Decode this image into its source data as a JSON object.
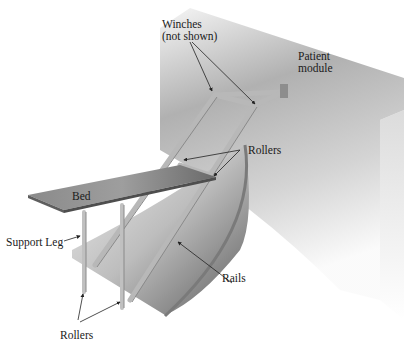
{
  "diagram": {
    "type": "technical-illustration",
    "labels": {
      "winches_line1": "Winches",
      "winches_line2": "(not shown)",
      "patient_module_line1": "Patient",
      "patient_module_line2": "module",
      "rollers_upper": "Rollers",
      "bed": "Bed",
      "support_leg": "Support Leg",
      "rails": "Rails",
      "rollers_lower": "Rollers"
    },
    "colors": {
      "background": "#ffffff",
      "text": "#1a1a1a",
      "module_dark": "#9a9a9a",
      "module_light": "#f2f2f2",
      "rail_surface_dark": "#6f6f6f",
      "rail_surface_light": "#e6e6e6",
      "frame": "#b5b5b5",
      "bed_dark": "#7a7a7a",
      "bed_light": "#d0d0d0"
    }
  }
}
